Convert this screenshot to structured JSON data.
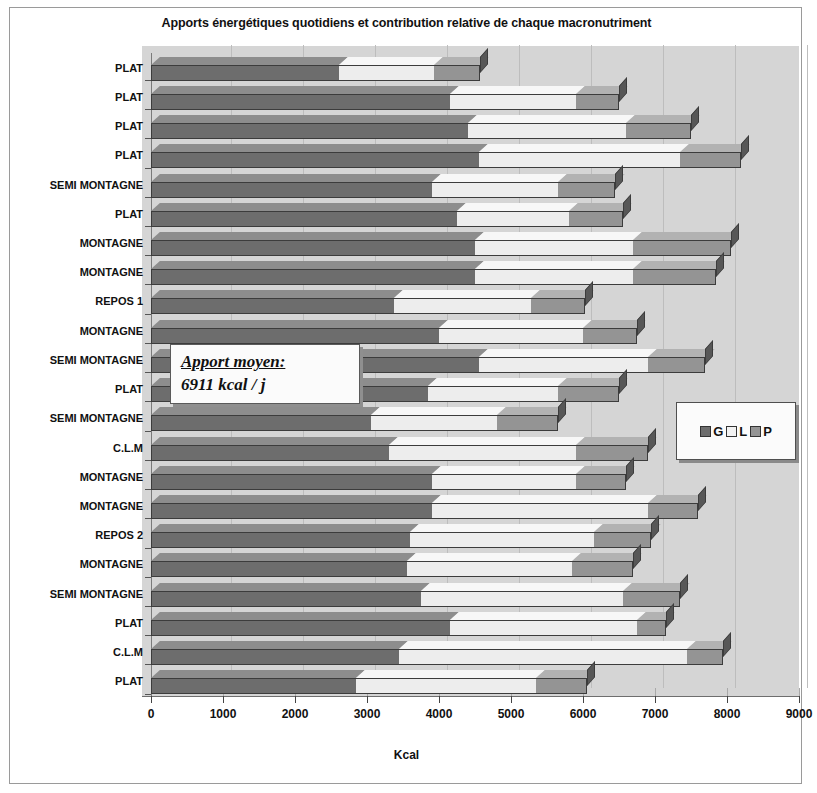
{
  "chart_data": {
    "type": "bar",
    "title": "Apports énergétiques quotidiens et contribution relative de chaque macronutriment",
    "xlabel": "Kcal",
    "ylabel": "",
    "orientation": "horizontal",
    "stacked": true,
    "xlim": [
      0,
      9000
    ],
    "xticks": [
      0,
      1000,
      2000,
      3000,
      4000,
      5000,
      6000,
      7000,
      8000,
      9000
    ],
    "xtick_labels": [
      "0",
      "1000",
      "2000",
      "3000",
      "4000",
      "5000",
      "6000",
      "7000",
      "8000",
      "9000"
    ],
    "grid": true,
    "legend_position": "right",
    "legend": [
      "G",
      "L",
      "P"
    ],
    "series": [
      {
        "name": "G",
        "values": [
          2610,
          4150,
          4400,
          4550,
          3900,
          4250,
          4500,
          4500,
          3380,
          4000,
          4550,
          3850,
          3050,
          3300,
          3900,
          3900,
          3600,
          3550,
          3750,
          4150,
          3450,
          2850
        ]
      },
      {
        "name": "L",
        "values": [
          1320,
          1750,
          2200,
          2800,
          1750,
          1550,
          2200,
          2200,
          1900,
          2000,
          2350,
          1800,
          1750,
          2600,
          2000,
          3000,
          2550,
          2300,
          2800,
          2600,
          4000,
          2500
        ]
      },
      {
        "name": "P",
        "values": [
          640,
          600,
          900,
          850,
          800,
          750,
          1350,
          1150,
          750,
          750,
          800,
          850,
          850,
          1000,
          700,
          700,
          800,
          850,
          800,
          400,
          500,
          700
        ]
      }
    ],
    "categories": [
      "PLAT",
      "PLAT",
      "PLAT",
      "PLAT",
      "SEMI MONTAGNE",
      "PLAT",
      "MONTAGNE",
      "MONTAGNE",
      "REPOS 1",
      "MONTAGNE",
      "SEMI MONTAGNE",
      "PLAT",
      "SEMI MONTAGNE",
      "C.L.M",
      "MONTAGNE",
      "MONTAGNE",
      "REPOS 2",
      "MONTAGNE",
      "SEMI MONTAGNE",
      "PLAT",
      "C.L.M",
      "PLAT"
    ],
    "annotation": {
      "line1": "Apport moyen:",
      "line2": "6911 kcal / j"
    },
    "colors": {
      "G": "#6d6d6d",
      "L": "#ededed",
      "P": "#949494",
      "plot_background": "#d5d5d5",
      "gridline": "#b0b0b0"
    }
  }
}
